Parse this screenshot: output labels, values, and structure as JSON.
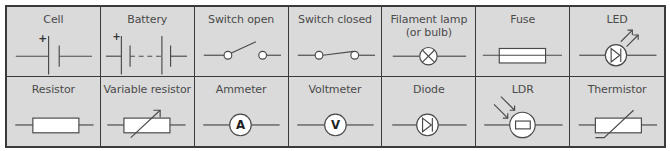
{
  "table": {
    "title": "Circuit symbols",
    "colors": {
      "background": "#dadada",
      "border": "#3a3a3a",
      "line": "#4a4a4a",
      "fill": "#ffffff",
      "text": "#4a4a4a"
    },
    "rows": [
      {
        "cells": [
          {
            "label": "Cell",
            "symbol": "cell-icon",
            "mark": "+"
          },
          {
            "label": "Battery",
            "symbol": "battery-icon",
            "mark": "+"
          },
          {
            "label": "Switch open",
            "symbol": "switch-open-icon"
          },
          {
            "label": "Switch closed",
            "symbol": "switch-closed-icon"
          },
          {
            "label": "Filament lamp",
            "label2": "(or bulb)",
            "symbol": "filament-lamp-icon"
          },
          {
            "label": "Fuse",
            "symbol": "fuse-icon"
          },
          {
            "label": "LED",
            "symbol": "led-icon"
          }
        ]
      },
      {
        "cells": [
          {
            "label": "Resistor",
            "symbol": "resistor-icon"
          },
          {
            "label": "Variable resistor",
            "symbol": "variable-resistor-icon"
          },
          {
            "label": "Ammeter",
            "symbol": "ammeter-icon",
            "mark": "A"
          },
          {
            "label": "Voltmeter",
            "symbol": "voltmeter-icon",
            "mark": "V"
          },
          {
            "label": "Diode",
            "symbol": "diode-icon"
          },
          {
            "label": "LDR",
            "symbol": "ldr-icon"
          },
          {
            "label": "Thermistor",
            "symbol": "thermistor-icon"
          }
        ]
      }
    ]
  }
}
